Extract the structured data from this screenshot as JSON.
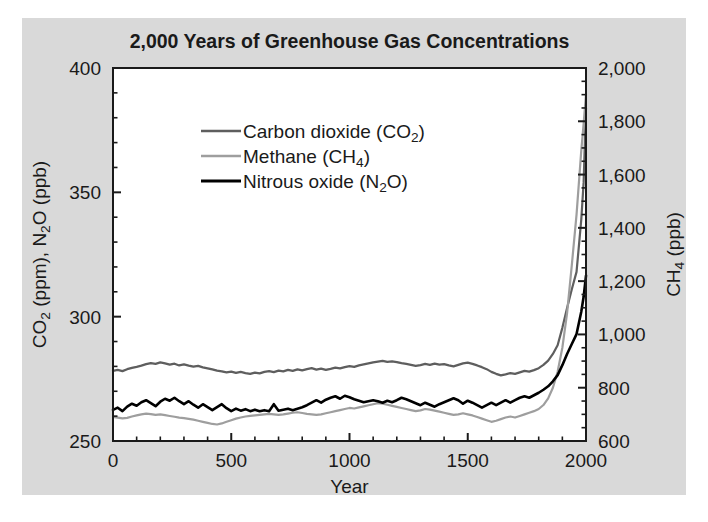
{
  "figure": {
    "background_color": "#d9d9d9",
    "page_color": "#ffffff",
    "plot_background": "#ffffff",
    "axis_color": "#1a1a1a"
  },
  "chart_data": {
    "type": "line",
    "title": "2,000 Years of Greenhouse Gas Concentrations",
    "xlabel": "Year",
    "ylabel": "CO2 (ppm), N2O (ppb)",
    "ylabel_parts": [
      "CO",
      "2",
      " (ppm), N",
      "2",
      "O (ppb)"
    ],
    "ylabel_right": "CH4 (ppb)",
    "ylabel_right_parts": [
      "CH",
      "4",
      " (ppb)"
    ],
    "grid": false,
    "legend_position": "upper-left-inside",
    "xlim": [
      0,
      2000
    ],
    "xticks": [
      0,
      500,
      1000,
      1500,
      2000
    ],
    "xticklabels": [
      "0",
      "500",
      "1000",
      "1500",
      "2000"
    ],
    "x_minor_interval": 100,
    "ylim_left": [
      250,
      400
    ],
    "yticks_left": [
      250,
      300,
      350,
      400
    ],
    "yticklabels_left": [
      "250",
      "300",
      "350",
      "400"
    ],
    "y_left_minor_interval": 10,
    "ylim_right": [
      600,
      2000
    ],
    "yticks_right": [
      600,
      800,
      1000,
      1200,
      1400,
      1600,
      1800,
      2000
    ],
    "yticklabels_right": [
      "600",
      "800",
      "1,000",
      "1,200",
      "1,400",
      "1,600",
      "1,800",
      "2,000"
    ],
    "y_right_minor_interval": 50,
    "series": [
      {
        "name": "Carbon dioxide (CO2)",
        "legend_label_parts": [
          "Carbon dioxide (CO",
          "2",
          ")"
        ],
        "axis": "left",
        "unit": "ppm",
        "color": "#5e5e5e",
        "width": 2.2,
        "x": [
          0,
          20,
          40,
          60,
          80,
          100,
          120,
          140,
          160,
          180,
          200,
          220,
          240,
          260,
          280,
          300,
          320,
          340,
          360,
          380,
          400,
          420,
          440,
          460,
          480,
          500,
          520,
          540,
          560,
          580,
          600,
          620,
          640,
          660,
          680,
          700,
          720,
          740,
          760,
          780,
          800,
          820,
          840,
          860,
          880,
          900,
          920,
          940,
          960,
          980,
          1000,
          1020,
          1040,
          1060,
          1080,
          1100,
          1120,
          1140,
          1160,
          1180,
          1200,
          1220,
          1240,
          1260,
          1280,
          1300,
          1320,
          1340,
          1360,
          1380,
          1400,
          1420,
          1440,
          1460,
          1480,
          1500,
          1520,
          1540,
          1560,
          1580,
          1600,
          1620,
          1640,
          1660,
          1680,
          1700,
          1720,
          1740,
          1760,
          1780,
          1800,
          1820,
          1840,
          1860,
          1880,
          1900,
          1920,
          1940,
          1960,
          1980,
          1990,
          2000
        ],
        "y": [
          278.2,
          278.6,
          278.1,
          278.9,
          279.4,
          279.8,
          280.3,
          280.9,
          281.3,
          281.0,
          281.6,
          281.2,
          280.7,
          281.1,
          280.4,
          280.8,
          280.3,
          279.9,
          280.2,
          279.6,
          279.2,
          278.8,
          278.3,
          278.0,
          277.6,
          277.9,
          277.4,
          277.8,
          277.3,
          277.0,
          277.5,
          277.2,
          277.8,
          278.1,
          277.7,
          278.3,
          278.0,
          278.6,
          278.2,
          278.8,
          278.4,
          278.9,
          279.3,
          278.7,
          279.1,
          278.6,
          279.0,
          279.5,
          279.2,
          279.7,
          280.1,
          279.8,
          280.4,
          280.8,
          281.2,
          281.6,
          281.9,
          282.2,
          281.8,
          282.0,
          281.7,
          281.3,
          281.0,
          280.6,
          280.2,
          280.5,
          281.0,
          280.6,
          281.1,
          280.7,
          280.9,
          280.4,
          280.0,
          280.6,
          281.2,
          281.5,
          281.0,
          280.4,
          279.7,
          278.9,
          277.8,
          277.0,
          276.4,
          276.8,
          277.3,
          277.0,
          277.6,
          278.2,
          277.9,
          278.5,
          279.3,
          280.6,
          282.3,
          285.0,
          288.5,
          295.5,
          303.5,
          311.0,
          318.0,
          339.0,
          354.0,
          384.0
        ]
      },
      {
        "name": "Methane (CH4)",
        "legend_label_parts": [
          "Methane (CH",
          "4",
          ")"
        ],
        "axis": "right",
        "unit": "ppb",
        "color": "#9e9e9e",
        "width": 2.2,
        "x": [
          0,
          20,
          40,
          60,
          80,
          100,
          120,
          140,
          160,
          180,
          200,
          220,
          240,
          260,
          280,
          300,
          320,
          340,
          360,
          380,
          400,
          420,
          440,
          460,
          480,
          500,
          520,
          540,
          560,
          580,
          600,
          620,
          640,
          660,
          680,
          700,
          720,
          740,
          760,
          780,
          800,
          820,
          840,
          860,
          880,
          900,
          920,
          940,
          960,
          980,
          1000,
          1020,
          1040,
          1060,
          1080,
          1100,
          1120,
          1140,
          1160,
          1180,
          1200,
          1220,
          1240,
          1260,
          1280,
          1300,
          1320,
          1340,
          1360,
          1380,
          1400,
          1420,
          1440,
          1460,
          1480,
          1500,
          1520,
          1540,
          1560,
          1580,
          1600,
          1620,
          1640,
          1660,
          1680,
          1700,
          1720,
          1740,
          1760,
          1780,
          1800,
          1820,
          1840,
          1860,
          1880,
          1900,
          1920,
          1940,
          1960,
          1980,
          1990,
          2000
        ],
        "y": [
          690,
          688,
          685,
          687,
          692,
          696,
          700,
          703,
          701,
          698,
          700,
          697,
          694,
          691,
          688,
          686,
          683,
          680,
          676,
          672,
          668,
          664,
          662,
          666,
          672,
          678,
          684,
          688,
          692,
          694,
          696,
          698,
          700,
          702,
          700,
          698,
          700,
          703,
          706,
          708,
          705,
          702,
          700,
          698,
          700,
          704,
          708,
          712,
          716,
          720,
          724,
          722,
          726,
          730,
          734,
          738,
          742,
          740,
          736,
          732,
          728,
          724,
          720,
          716,
          712,
          715,
          720,
          718,
          714,
          710,
          706,
          702,
          698,
          700,
          704,
          700,
          696,
          690,
          684,
          678,
          672,
          676,
          682,
          688,
          692,
          688,
          694,
          700,
          706,
          712,
          720,
          735,
          760,
          800,
          860,
          950,
          1080,
          1260,
          1450,
          1690,
          1790,
          1900
        ]
      },
      {
        "name": "Nitrous oxide (N2O)",
        "legend_label_parts": [
          "Nitrous oxide (N",
          "2",
          "O)"
        ],
        "axis": "left",
        "unit": "ppb",
        "color": "#000000",
        "width": 2.6,
        "x": [
          0,
          20,
          40,
          60,
          80,
          100,
          120,
          140,
          160,
          180,
          200,
          220,
          240,
          260,
          280,
          300,
          320,
          340,
          360,
          380,
          400,
          420,
          440,
          460,
          480,
          500,
          520,
          540,
          560,
          580,
          600,
          620,
          640,
          660,
          680,
          700,
          720,
          740,
          760,
          780,
          800,
          820,
          840,
          860,
          880,
          900,
          920,
          940,
          960,
          980,
          1000,
          1020,
          1040,
          1060,
          1080,
          1100,
          1120,
          1140,
          1160,
          1180,
          1200,
          1220,
          1240,
          1260,
          1280,
          1300,
          1320,
          1340,
          1360,
          1380,
          1400,
          1420,
          1440,
          1460,
          1480,
          1500,
          1520,
          1540,
          1560,
          1580,
          1600,
          1620,
          1640,
          1660,
          1680,
          1700,
          1720,
          1740,
          1760,
          1780,
          1800,
          1820,
          1840,
          1860,
          1880,
          1900,
          1920,
          1940,
          1960,
          1980,
          1990,
          2000
        ],
        "y": [
          262.5,
          263.4,
          262.0,
          263.8,
          265.0,
          264.2,
          265.6,
          266.4,
          265.2,
          264.0,
          265.8,
          267.0,
          266.2,
          267.4,
          266.0,
          264.8,
          266.0,
          264.6,
          263.4,
          264.8,
          263.6,
          262.4,
          263.6,
          264.8,
          263.2,
          262.0,
          263.0,
          262.2,
          262.8,
          262.0,
          262.6,
          262.0,
          262.4,
          262.0,
          264.8,
          262.2,
          262.6,
          263.0,
          262.4,
          263.0,
          263.6,
          264.4,
          265.4,
          266.4,
          265.4,
          266.6,
          267.4,
          268.0,
          267.0,
          268.2,
          267.6,
          266.8,
          266.2,
          265.6,
          266.0,
          266.4,
          266.0,
          265.4,
          266.2,
          265.6,
          266.4,
          267.4,
          266.8,
          266.0,
          265.2,
          264.4,
          265.4,
          264.6,
          263.8,
          264.8,
          265.6,
          266.4,
          267.2,
          266.4,
          265.0,
          266.2,
          265.4,
          264.4,
          263.4,
          264.4,
          265.4,
          264.4,
          265.4,
          266.4,
          265.4,
          266.4,
          267.4,
          268.0,
          267.4,
          268.4,
          269.4,
          270.6,
          272.0,
          274.0,
          276.5,
          280.5,
          285.0,
          289.0,
          293.0,
          302.0,
          308.0,
          316.5
        ]
      }
    ]
  },
  "legend": {
    "entries": [
      {
        "label": "Carbon dioxide (CO2)",
        "color": "#5e5e5e"
      },
      {
        "label": "Methane (CH4)",
        "color": "#9e9e9e"
      },
      {
        "label": "Nitrous oxide (N2O)",
        "color": "#000000"
      }
    ]
  }
}
